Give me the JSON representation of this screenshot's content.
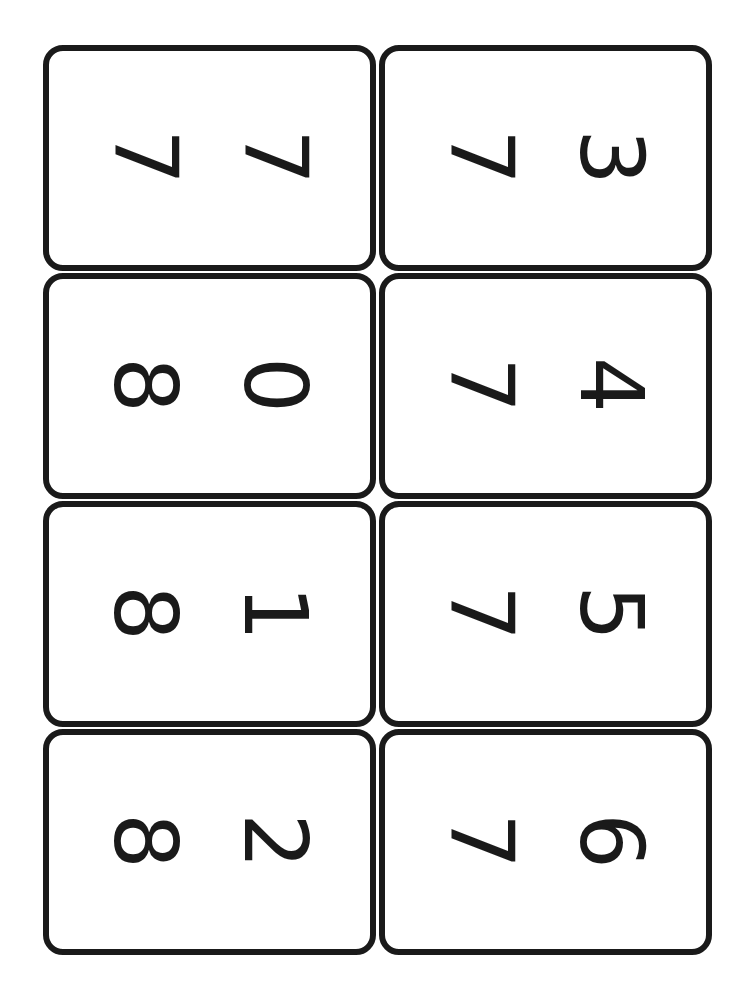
{
  "sheet": {
    "orientation": "rotated 90deg clockwise",
    "border_color": "#1a1a1a",
    "background_color": "#ffffff",
    "cards": [
      {
        "number": "77",
        "digits": [
          "7",
          "7"
        ]
      },
      {
        "number": "73",
        "digits": [
          "7",
          "3"
        ]
      },
      {
        "number": "80",
        "digits": [
          "8",
          "0"
        ]
      },
      {
        "number": "74",
        "digits": [
          "7",
          "4"
        ]
      },
      {
        "number": "81",
        "digits": [
          "8",
          "1"
        ]
      },
      {
        "number": "75",
        "digits": [
          "7",
          "5"
        ]
      },
      {
        "number": "82",
        "digits": [
          "8",
          "2"
        ]
      },
      {
        "number": "76",
        "digits": [
          "7",
          "6"
        ]
      }
    ]
  }
}
